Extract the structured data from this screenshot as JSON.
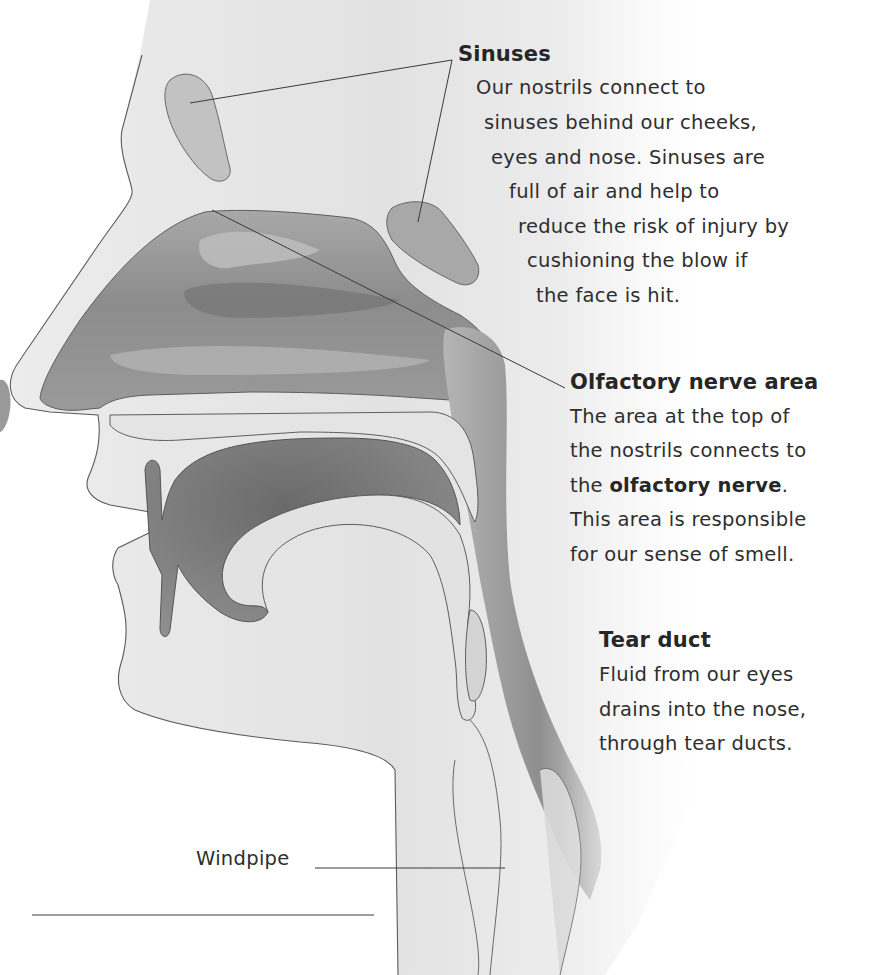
{
  "diagram": {
    "colors": {
      "background": "#ffffff",
      "skin": "#e6e6e6",
      "airway": "#8a8a8a",
      "airway_dark": "#5e5e5e",
      "outline": "#555555",
      "text": "#2a2a2a"
    }
  },
  "labels": {
    "sinuses": {
      "title": "Sinuses",
      "lines": [
        "Our nostrils connect to",
        "sinuses behind our cheeks,",
        "eyes and nose. Sinuses are",
        "full of air and help to",
        "reduce the risk of injury by",
        "cushioning the blow if",
        "the face is hit."
      ]
    },
    "olfactory": {
      "title": "Olfactory nerve area",
      "lines": [
        "The area at the top of",
        "the nostrils connects to",
        "the",
        "olfactory nerve",
        ".",
        "This area is responsible",
        "for our sense of smell."
      ]
    },
    "tear_duct": {
      "title": "Tear duct",
      "lines": [
        "Fluid from our eyes",
        "drains into the nose,",
        "through tear ducts."
      ]
    },
    "windpipe": {
      "title": "Windpipe"
    }
  }
}
